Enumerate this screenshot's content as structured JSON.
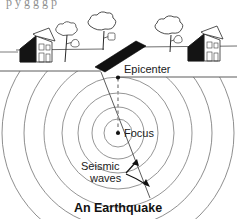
{
  "figure": {
    "title": "An Earthquake",
    "clipped_text_above": "p        y  g   g      g       p",
    "labels": {
      "epicenter": "Epicenter",
      "focus": "Focus",
      "seismic_waves_line1": "Seismic",
      "seismic_waves_line2": "waves"
    },
    "colors": {
      "ink": "#1a1a1a",
      "fault": "#111111",
      "wave_stroke": "#7a7a7a",
      "ground_stroke": "#6e6e6e",
      "dashed_stroke": "#9a9a9a",
      "house_shadow": "#141414",
      "background": "#ffffff"
    },
    "geometry": {
      "focus_point": {
        "x": 118,
        "y": 133
      },
      "epicenter_point": {
        "x": 118,
        "y": 77
      },
      "wave_radii": [
        14,
        26,
        40,
        56,
        74,
        94,
        116
      ],
      "ground_line_left_y": 71,
      "ground_line_right_y": 48,
      "surface_clip_y": 77
    },
    "scene_objects": [
      {
        "name": "house-left",
        "x": 30,
        "y": 46
      },
      {
        "name": "tree-left",
        "x": 68,
        "y": 42
      },
      {
        "name": "tree-center",
        "x": 105,
        "y": 36
      },
      {
        "name": "tree-right",
        "x": 172,
        "y": 36
      },
      {
        "name": "house-right",
        "x": 205,
        "y": 48
      },
      {
        "name": "fault-plane",
        "x": 100,
        "y": 50
      }
    ]
  }
}
